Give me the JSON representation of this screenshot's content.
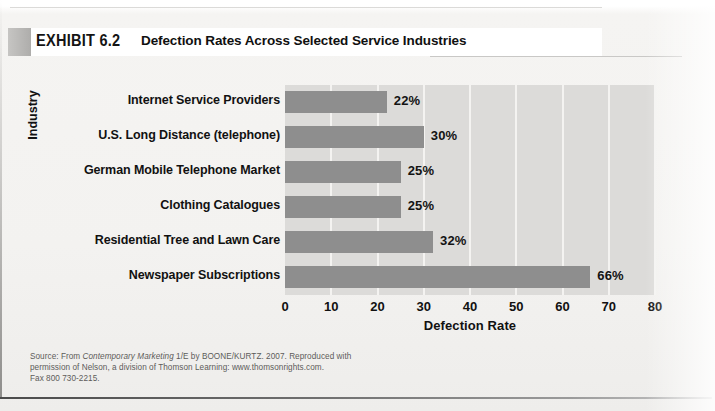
{
  "exhibit": {
    "tag": "EXHIBIT 6.2",
    "title": "Defection Rates Across Selected Service Industries"
  },
  "chart_data": {
    "type": "bar",
    "orientation": "horizontal",
    "title": "Defection Rates Across Selected Service Industries",
    "categories": [
      "Internet Service Providers",
      "U.S. Long Distance (telephone)",
      "German Mobile Telephone Market",
      "Clothing Catalogues",
      "Residential Tree and Lawn Care",
      "Newspaper Subscriptions"
    ],
    "values": [
      22,
      30,
      25,
      25,
      32,
      66
    ],
    "value_labels": [
      "22%",
      "30%",
      "25%",
      "25%",
      "32%",
      "66%"
    ],
    "xlabel": "Defection Rate",
    "ylabel": "Industry",
    "xlim": [
      0,
      80
    ],
    "xticks": [
      0,
      10,
      20,
      30,
      40,
      50,
      60,
      70,
      80
    ],
    "xtick_labels": [
      "0",
      "10",
      "20",
      "30",
      "40",
      "50",
      "60",
      "70",
      "80"
    ],
    "grid": "vertical",
    "legend": "none",
    "bar_color": "#8e8e8e",
    "plot_background": "#dcdbd9",
    "gridline_color": "#f4f3f1"
  },
  "source": {
    "line1_pre": "Source: From ",
    "line1_italic": "Contemporary Marketing",
    "line1_post": " 1/E by BOONE/KURTZ. 2007. Reproduced with",
    "line2": "permission of Nelson, a division of Thomson Learning: www.thomsonrights.com.",
    "line3": "Fax 800 730-2215."
  }
}
